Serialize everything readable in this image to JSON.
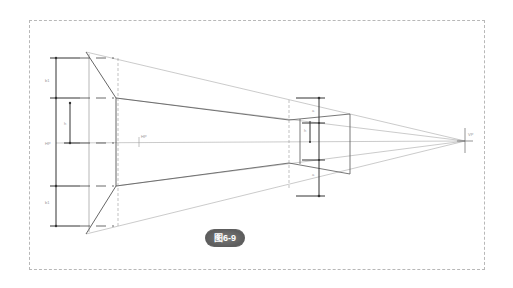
{
  "figure": {
    "caption": "图6-9",
    "badge_color": "#606060"
  },
  "labels": {
    "horizon_left": "HP",
    "horizon_center": "HP",
    "vanishing_point": "VP",
    "dim_top": "b1",
    "dim_middle": "b1",
    "dim_bottom": "b1",
    "dim_inner": "h",
    "right_dim_top": "a",
    "right_dim_inner": "h",
    "right_dim_bottom": "a"
  },
  "colors": {
    "line": "#555555",
    "light_line": "#a8a8a8",
    "frame": "#b8b8b8"
  }
}
